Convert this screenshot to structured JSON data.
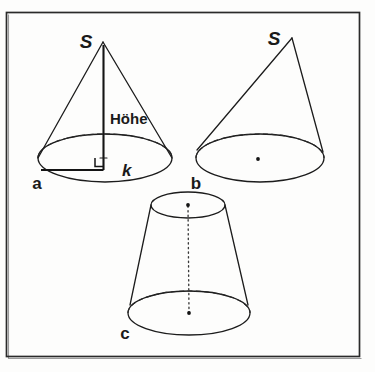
{
  "figure": {
    "background_color": "#fdfdfc",
    "ink_color": "#1c1c1c",
    "frame": {
      "x": 6,
      "y": 12,
      "width": 354,
      "height": 345
    },
    "parts": [
      {
        "id": "a",
        "label": "a",
        "name": "gerader-kreiskegel",
        "apex_label": "S",
        "labels": {
          "height": "Höhe",
          "radius": "k"
        }
      },
      {
        "id": "b",
        "label": "b",
        "name": "schiefer-kreiskegel",
        "apex_label": "S",
        "labels": {}
      },
      {
        "id": "c",
        "label": "c",
        "name": "kegelstumpf",
        "apex_label": "",
        "labels": {}
      }
    ],
    "labels": {
      "apex_a": "S",
      "apex_b": "S",
      "height_a": "Höhe",
      "radius_a": "k",
      "part_a": "a",
      "part_b": "b",
      "part_c": "c"
    }
  }
}
